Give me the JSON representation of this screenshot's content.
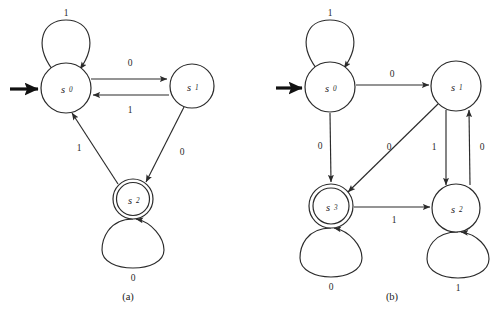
{
  "figure": {
    "background": "#ffffff",
    "stroke_color": "#2b2b2b",
    "text_color": "#1a1a1a"
  },
  "diagrams": [
    {
      "caption": "(a)",
      "caption_x": 128,
      "caption_y": 296,
      "start_marker": true,
      "nodes": [
        {
          "id": "a_s0",
          "name": "s",
          "sub": "0",
          "cx": 66,
          "cy": 88,
          "r": 25,
          "accepting": false
        },
        {
          "id": "a_s1",
          "name": "s",
          "sub": "1",
          "cx": 192,
          "cy": 86,
          "r": 22,
          "accepting": false
        },
        {
          "id": "a_s2",
          "name": "s",
          "sub": "2",
          "cx": 133,
          "cy": 199,
          "r": 20,
          "accepting": true
        }
      ],
      "self_loops": [
        {
          "node": "a_s0",
          "label": "1",
          "label_x": 66,
          "label_y": 13,
          "side": "top"
        },
        {
          "node": "a_s2",
          "label": "0",
          "label_x": 133,
          "label_y": 271,
          "side": "bottom"
        }
      ],
      "edges": [
        {
          "from": "a_s0",
          "to": "a_s1",
          "label": "0",
          "label_x": 130,
          "label_y": 63
        },
        {
          "from": "a_s1",
          "to": "a_s0",
          "label": "1",
          "label_x": 130,
          "label_y": 110
        },
        {
          "from": "a_s1",
          "to": "a_s2",
          "label": "0",
          "label_x": 182,
          "label_y": 152
        },
        {
          "from": "a_s2",
          "to": "a_s0",
          "label": "1",
          "label_x": 79,
          "label_y": 148
        }
      ]
    },
    {
      "caption": "(b)",
      "caption_x": 392,
      "caption_y": 296,
      "start_marker": true,
      "nodes": [
        {
          "id": "b_s0",
          "name": "s",
          "sub": "0",
          "cx": 330,
          "cy": 87,
          "r": 25,
          "accepting": false
        },
        {
          "id": "b_s1",
          "name": "s",
          "sub": "1",
          "cx": 456,
          "cy": 86,
          "r": 25,
          "accepting": false
        },
        {
          "id": "b_s2",
          "name": "s",
          "sub": "2",
          "cx": 456,
          "cy": 208,
          "r": 24,
          "accepting": false
        },
        {
          "id": "b_s3",
          "name": "s",
          "sub": "3",
          "cx": 331,
          "cy": 206,
          "r": 22,
          "accepting": true
        }
      ],
      "self_loops": [
        {
          "node": "b_s0",
          "label": "1",
          "label_x": 330,
          "label_y": 13,
          "side": "top"
        },
        {
          "node": "b_s3",
          "label": "0",
          "label_x": 331,
          "label_y": 280,
          "side": "bottom"
        },
        {
          "node": "b_s2",
          "label": "1",
          "label_x": 458,
          "label_y": 280,
          "side": "bottom"
        }
      ],
      "edges": [
        {
          "from": "b_s0",
          "to": "b_s1",
          "label": "0",
          "label_x": 392,
          "label_y": 74
        },
        {
          "from": "b_s0",
          "to": "b_s3",
          "label": "0",
          "label_x": 320,
          "label_y": 146
        },
        {
          "from": "b_s1",
          "to": "b_s3",
          "label": "0",
          "label_x": 389,
          "label_y": 147
        },
        {
          "from": "b_s1",
          "to": "b_s2",
          "label": "1",
          "label_x": 433,
          "label_y": 147
        },
        {
          "from": "b_s2",
          "to": "b_s1",
          "label": "0",
          "label_x": 481,
          "label_y": 147
        },
        {
          "from": "b_s3",
          "to": "b_s2",
          "label": "1",
          "label_x": 394,
          "label_y": 219
        }
      ]
    }
  ]
}
